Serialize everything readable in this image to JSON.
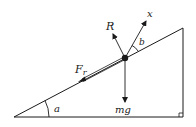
{
  "diagram": {
    "type": "inclined-plane-free-body",
    "labels": {
      "normal_force": "R",
      "axis": "x",
      "angle_b": "b",
      "friction": "F",
      "friction_sub": "r",
      "weight": "mg",
      "angle_a": "a"
    },
    "colors": {
      "line": "#1a1a1a",
      "background": "#ffffff"
    }
  }
}
